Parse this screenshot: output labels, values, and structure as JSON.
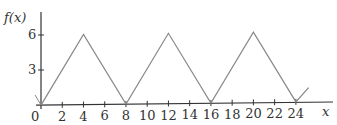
{
  "chart_data": {
    "type": "line",
    "title": "",
    "xlabel": "x",
    "ylabel": "f(x)",
    "xlim": [
      0,
      27
    ],
    "ylim": [
      0,
      7
    ],
    "x_ticks": [
      0,
      2,
      4,
      6,
      8,
      10,
      12,
      14,
      16,
      18,
      20,
      22,
      24
    ],
    "y_ticks": [
      3,
      6
    ],
    "grid": false,
    "legend": null,
    "series": [
      {
        "name": "f(x)",
        "x": [
          0,
          4,
          8,
          12,
          16,
          20,
          24,
          25.2
        ],
        "y": [
          0,
          6,
          0,
          6,
          0,
          6,
          0,
          1.2
        ]
      }
    ],
    "colors": {
      "axis": "#333333",
      "line": "#888888"
    }
  },
  "labels": {
    "ylabel": "f(x)",
    "xlabel": "x",
    "origin": "0",
    "y_tick_labels": [
      "3",
      "6"
    ],
    "x_tick_labels": [
      "2",
      "4",
      "6",
      "8",
      "10",
      "12",
      "14",
      "16",
      "18",
      "20",
      "22",
      "24"
    ]
  }
}
